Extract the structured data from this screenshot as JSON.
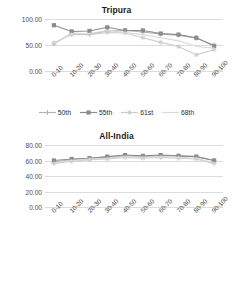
{
  "chart_data": [
    {
      "type": "line",
      "title": "Tripura",
      "xlabel": "",
      "ylabel": "",
      "ylim": [
        0,
        100
      ],
      "yticks": [
        "0.00",
        "50.00",
        "100.00"
      ],
      "ytick_values": [
        0,
        50,
        100
      ],
      "grid": true,
      "legend_position": "bottom",
      "categories": [
        "0-10",
        "10-20",
        "20-30",
        "30-40",
        "40-50",
        "50-60",
        "60-70",
        "70-80",
        "80-90",
        "90-100"
      ],
      "series": [
        {
          "name": "50th",
          "marker": "plus",
          "color": "#b3b3b3",
          "values": [
            52,
            73,
            71,
            77,
            78,
            75,
            71,
            69,
            63,
            50
          ]
        },
        {
          "name": "55th",
          "marker": "square",
          "color": "#8c8c8c",
          "values": [
            88,
            76,
            77,
            84,
            78,
            78,
            72,
            70,
            64,
            48
          ]
        },
        {
          "name": "61st",
          "marker": "star",
          "color": "#cccccc",
          "values": [
            54,
            70,
            70,
            74,
            73,
            64,
            55,
            47,
            31,
            41
          ]
        },
        {
          "name": "68th",
          "marker": "none",
          "color": "#d9d9d9",
          "values": [
            53,
            72,
            72,
            78,
            74,
            70,
            64,
            58,
            47,
            44
          ]
        }
      ]
    },
    {
      "type": "line",
      "title": "All-India",
      "xlabel": "",
      "ylabel": "",
      "ylim": [
        0,
        80
      ],
      "yticks": [
        "0.00",
        "20.00",
        "40.00",
        "60.00",
        "80.00"
      ],
      "ytick_values": [
        0,
        20,
        40,
        60,
        80
      ],
      "grid": true,
      "legend_position": "bottom",
      "categories": [
        "0-10",
        "10-20",
        "20-30",
        "30-40",
        "40-50",
        "50-60",
        "60-70",
        "70-80",
        "80-90",
        "90-100"
      ],
      "series": [
        {
          "name": "50th",
          "marker": "plus",
          "color": "#b3b3b3",
          "values": [
            58,
            61,
            63,
            64,
            66,
            65,
            66,
            66,
            65,
            60
          ]
        },
        {
          "name": "55th",
          "marker": "square",
          "color": "#8c8c8c",
          "values": [
            60,
            62,
            63,
            65,
            67,
            66,
            67,
            66,
            65,
            60
          ]
        },
        {
          "name": "61st",
          "marker": "star",
          "color": "#cccccc",
          "values": [
            56,
            59,
            61,
            62,
            64,
            63,
            64,
            63,
            62,
            56
          ]
        },
        {
          "name": "68th",
          "marker": "none",
          "color": "#d9d9d9",
          "values": [
            57,
            60,
            62,
            63,
            65,
            64,
            65,
            64,
            63,
            57
          ]
        }
      ]
    }
  ],
  "colors": {
    "grid": "#dcdcdc",
    "text": "#4d4d4d",
    "title": "#1a1a1a"
  }
}
